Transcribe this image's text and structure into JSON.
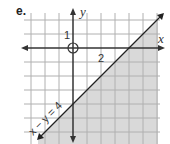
{
  "problem_label": "e.",
  "axes": {
    "x_label": "x",
    "y_label": "y"
  },
  "ticks": {
    "y_tick_label": "1",
    "x_tick_label": "2"
  },
  "boundary_line": {
    "equation_label": "x − y = 4",
    "slope": 1,
    "x_intercept": 4,
    "y_intercept": -4,
    "style": "solid"
  },
  "shaded_region": {
    "description": "below/right of line (x - y ≥ 4)",
    "color": "#d9d9d9"
  },
  "origin_marker": "open-circle",
  "grid": {
    "unit_px": 14,
    "color": "#aaaaaa"
  },
  "colors": {
    "axis": "#333333",
    "line": "#222222",
    "shade": "#d9d9d9",
    "grid": "#b0b0b0"
  }
}
